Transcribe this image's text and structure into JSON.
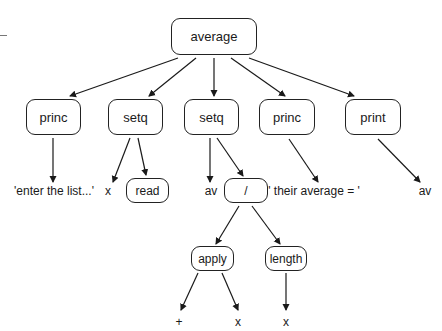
{
  "diagram": {
    "type": "expression-tree",
    "root": {
      "id": "average",
      "label": "average"
    },
    "nodes": [
      {
        "id": "average",
        "label": "average",
        "boxed": true,
        "x": 171,
        "y": 18,
        "w": 86,
        "h": 37
      },
      {
        "id": "princ1",
        "label": "princ",
        "boxed": true,
        "x": 26,
        "y": 99,
        "w": 55,
        "h": 36
      },
      {
        "id": "setq1",
        "label": "setq",
        "boxed": true,
        "x": 108,
        "y": 99,
        "w": 55,
        "h": 36
      },
      {
        "id": "setq2",
        "label": "setq",
        "boxed": true,
        "x": 184,
        "y": 99,
        "w": 55,
        "h": 36
      },
      {
        "id": "princ2",
        "label": "princ",
        "boxed": true,
        "x": 259,
        "y": 99,
        "w": 56,
        "h": 36
      },
      {
        "id": "print",
        "label": "print",
        "boxed": true,
        "x": 345,
        "y": 99,
        "w": 56,
        "h": 36
      },
      {
        "id": "read",
        "label": "read",
        "boxed": true,
        "x": 126,
        "y": 178,
        "w": 43,
        "h": 25
      },
      {
        "id": "div",
        "label": "/",
        "boxed": true,
        "x": 224,
        "y": 178,
        "w": 44,
        "h": 25
      },
      {
        "id": "apply",
        "label": "apply",
        "boxed": true,
        "x": 191,
        "y": 246,
        "w": 43,
        "h": 25
      },
      {
        "id": "length",
        "label": "length",
        "boxed": true,
        "x": 265,
        "y": 246,
        "w": 42,
        "h": 25
      }
    ],
    "leaves": [
      {
        "id": "str1",
        "label": "'enter the list...'",
        "x": 54,
        "y": 184
      },
      {
        "id": "x1",
        "label": "x",
        "x": 108,
        "y": 184
      },
      {
        "id": "av1",
        "label": "av",
        "x": 211,
        "y": 184
      },
      {
        "id": "str2",
        "label": "' their average = '",
        "x": 314,
        "y": 184
      },
      {
        "id": "av2",
        "label": "av",
        "x": 425,
        "y": 184
      },
      {
        "id": "plus",
        "label": "+",
        "x": 179,
        "y": 315
      },
      {
        "id": "x2",
        "label": "x",
        "x": 238,
        "y": 315
      },
      {
        "id": "x3",
        "label": "x",
        "x": 286,
        "y": 315
      }
    ],
    "edges": [
      {
        "from": "average",
        "to": "princ1",
        "x1": 178,
        "y1": 58,
        "x2": 70,
        "y2": 96
      },
      {
        "from": "average",
        "to": "setq1",
        "x1": 196,
        "y1": 58,
        "x2": 149,
        "y2": 96
      },
      {
        "from": "average",
        "to": "setq2",
        "x1": 214,
        "y1": 58,
        "x2": 214,
        "y2": 96
      },
      {
        "from": "average",
        "to": "princ2",
        "x1": 231,
        "y1": 58,
        "x2": 285,
        "y2": 96
      },
      {
        "from": "average",
        "to": "print",
        "x1": 249,
        "y1": 58,
        "x2": 354,
        "y2": 96
      },
      {
        "from": "princ1",
        "to": "str1",
        "x1": 53,
        "y1": 138,
        "x2": 53,
        "y2": 182
      },
      {
        "from": "setq1",
        "to": "x1",
        "x1": 130,
        "y1": 138,
        "x2": 113,
        "y2": 182
      },
      {
        "from": "setq1",
        "to": "read",
        "x1": 138,
        "y1": 138,
        "x2": 146,
        "y2": 175
      },
      {
        "from": "setq2",
        "to": "av1",
        "x1": 210,
        "y1": 138,
        "x2": 210,
        "y2": 182
      },
      {
        "from": "setq2",
        "to": "div",
        "x1": 217,
        "y1": 138,
        "x2": 243,
        "y2": 176
      },
      {
        "from": "princ2",
        "to": "str2",
        "x1": 289,
        "y1": 139,
        "x2": 318,
        "y2": 182
      },
      {
        "from": "print",
        "to": "av2",
        "x1": 378,
        "y1": 139,
        "x2": 420,
        "y2": 182
      },
      {
        "from": "div",
        "to": "apply",
        "x1": 239,
        "y1": 206,
        "x2": 216,
        "y2": 244
      },
      {
        "from": "div",
        "to": "length",
        "x1": 252,
        "y1": 206,
        "x2": 280,
        "y2": 244
      },
      {
        "from": "apply",
        "to": "plus",
        "x1": 198,
        "y1": 273,
        "x2": 181,
        "y2": 310
      },
      {
        "from": "apply",
        "to": "x2",
        "x1": 222,
        "y1": 273,
        "x2": 238,
        "y2": 310
      },
      {
        "from": "length",
        "to": "x3",
        "x1": 286,
        "y1": 273,
        "x2": 286,
        "y2": 310
      }
    ]
  },
  "colors": {
    "line": "#1a1a1a",
    "background": "#ffffff"
  }
}
